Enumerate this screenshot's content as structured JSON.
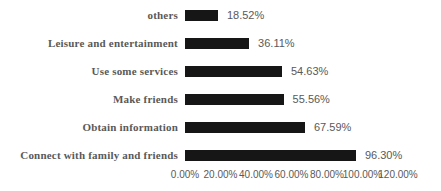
{
  "chart_data": {
    "type": "bar",
    "orientation": "horizontal",
    "title": "",
    "xlabel": "",
    "ylabel": "",
    "xlim": [
      0,
      120
    ],
    "grid": false,
    "legend": false,
    "categories": [
      "others",
      "Leisure and entertainment",
      "Use some services",
      "Make friends",
      "Obtain information",
      "Connect with family and friends"
    ],
    "values": [
      18.52,
      36.11,
      54.63,
      55.56,
      67.59,
      96.3
    ],
    "value_labels": [
      "18.52%",
      "36.11%",
      "54.63%",
      "55.56%",
      "67.59%",
      "96.30%"
    ],
    "x_tick_values": [
      0,
      20,
      40,
      60,
      80,
      100,
      120
    ],
    "x_tick_labels": [
      "0.00%",
      "20.00%",
      "40.00%",
      "60.00%",
      "80.00%",
      "100.00%",
      "120.00%"
    ]
  },
  "colors": {
    "background": "#ffffff",
    "bar": "#161616",
    "category_label": "#595959",
    "value_label": "#595959",
    "axis_label": "#595959"
  }
}
